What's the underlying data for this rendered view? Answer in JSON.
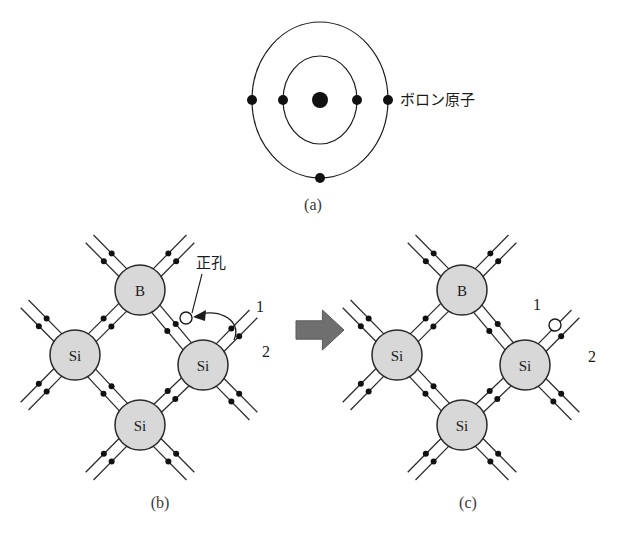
{
  "figure": {
    "background_color": "#ffffff",
    "line_color": "#1c1c1c",
    "atom_fill_color": "#d8d8d8",
    "hole_fill_color": "#ffffff",
    "block_arrow_color": "#6f6f6f"
  },
  "panel_a": {
    "caption": "(a)",
    "annotation": "ボロン原子",
    "nucleus": {
      "cx": 320,
      "cy": 100,
      "r": 8
    },
    "shells": [
      {
        "name": "inner-shell",
        "rx": 37,
        "ry": 44,
        "electron_count": 2
      },
      {
        "name": "outer-shell",
        "rx": 68,
        "ry": 78,
        "electron_count": 3
      }
    ],
    "inner_electrons": [
      {
        "x": 283,
        "y": 100
      },
      {
        "x": 357,
        "y": 100
      }
    ],
    "outer_electrons": [
      {
        "x": 252,
        "y": 100
      },
      {
        "x": 388,
        "y": 100
      },
      {
        "x": 320,
        "y": 178
      }
    ],
    "annotation_x": 400,
    "annotation_y": 105
  },
  "panel_b": {
    "caption": "(b)",
    "caption_x": 160,
    "caption_y": 508,
    "origin_x": 0,
    "origin_y": 0,
    "hole_label": "正孔",
    "hole_label_x": 196,
    "hole_label_y": 268,
    "index_1": "1",
    "index_1_x": 256,
    "index_1_y": 312,
    "index_2": "2",
    "index_2_x": 262,
    "index_2_y": 357,
    "atoms": [
      {
        "id": "b-top",
        "label": "B",
        "cx": 140,
        "cy": 290,
        "r": 25
      },
      {
        "id": "si-left",
        "label": "Si",
        "cx": 75,
        "cy": 355,
        "r": 25
      },
      {
        "id": "si-right",
        "label": "Si",
        "cx": 203,
        "cy": 365,
        "r": 25
      },
      {
        "id": "si-bottom",
        "label": "Si",
        "cx": 140,
        "cy": 425,
        "r": 25
      }
    ],
    "hole": {
      "cx": 186,
      "cy": 318,
      "r": 6
    }
  },
  "panel_c": {
    "caption": "(c)",
    "caption_x": 468,
    "caption_y": 508,
    "index_1": "1",
    "index_1_x": 533,
    "index_1_y": 310,
    "index_2": "2",
    "index_2_x": 588,
    "index_2_y": 362,
    "atoms": [
      {
        "id": "b-top",
        "label": "B",
        "cx": 462,
        "cy": 290,
        "r": 25
      },
      {
        "id": "si-left",
        "label": "Si",
        "cx": 397,
        "cy": 355,
        "r": 25
      },
      {
        "id": "si-right",
        "label": "Si",
        "cx": 525,
        "cy": 365,
        "r": 25
      },
      {
        "id": "si-bottom",
        "label": "Si",
        "cx": 462,
        "cy": 425,
        "r": 25
      }
    ],
    "hole": {
      "cx": 555,
      "cy": 325,
      "r": 6
    }
  },
  "transition_arrow": {
    "name": "rightward-block-arrow",
    "x": 296,
    "y": 310,
    "width": 48,
    "height": 40
  }
}
